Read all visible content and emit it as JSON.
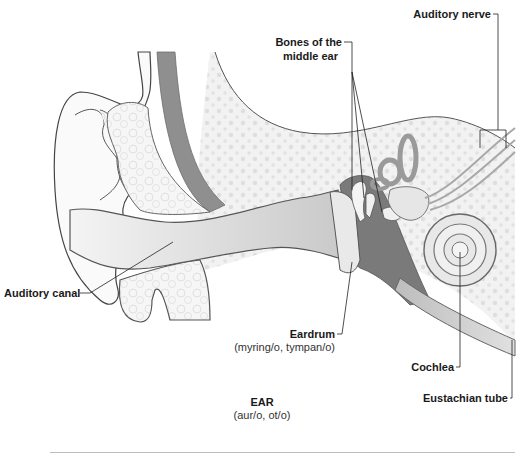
{
  "diagram": {
    "title": "EAR",
    "subtitle": "(aur/o, ot/o)",
    "labels": {
      "auditory_nerve": "Auditory nerve",
      "bones_line1": "Bones of the",
      "bones_line2": "middle ear",
      "auditory_canal": "Auditory canal",
      "eardrum": "Eardrum",
      "eardrum_roots": "(myring/o, tympan/o)",
      "cochlea": "Cochlea",
      "eustachian_tube": "Eustachian tube"
    },
    "colors": {
      "background": "#ffffff",
      "bone_fill": "#f1f1f1",
      "bone_dots": "#dcdcdc",
      "skin_outline": "#555555",
      "canal_fill": "#d6d6d6",
      "dark_band": "#8a8a8a",
      "middle_ear_cavity": "#7a7a7a",
      "leader_line": "#222222"
    }
  }
}
